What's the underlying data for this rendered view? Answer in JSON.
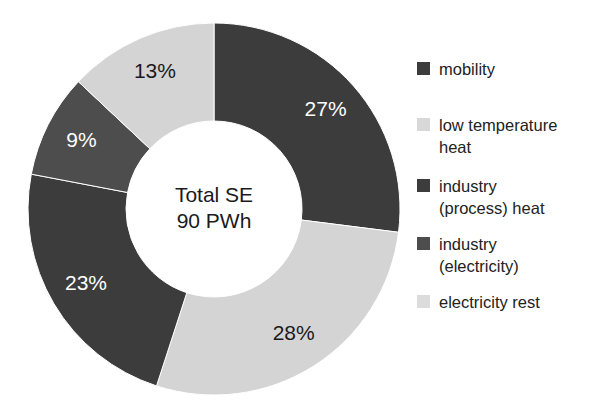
{
  "chart_data": {
    "type": "pie",
    "variant": "donut",
    "title": "",
    "subtitle": "",
    "xlabel": "",
    "ylabel": "",
    "center_label_line1": "Total SE",
    "center_label_line2": "90 PWh",
    "total_value": 90,
    "total_unit": "PWh",
    "grid": false,
    "legend_position": "right",
    "start_angle_deg": 0,
    "direction": "clockwise",
    "categories": [
      "mobility",
      "low temperature heat",
      "industry (process) heat",
      "industry (electricity)",
      "electricity rest"
    ],
    "values": [
      27,
      28,
      23,
      9,
      13
    ],
    "value_unit": "%",
    "data_labels": [
      "27%",
      "28%",
      "23%",
      "9%",
      "13%"
    ],
    "colors": [
      "#3c3c3c",
      "#d4d4d4",
      "#3c3c3c",
      "#4d4d4d",
      "#d4d4d4"
    ],
    "label_text_colors": [
      "#ffffff",
      "#1a1a1a",
      "#ffffff",
      "#ffffff",
      "#1a1a1a"
    ],
    "slices": [
      {
        "name": "mobility",
        "value": 27,
        "label": "27%",
        "color": "#3c3c3c",
        "label_on": "dark"
      },
      {
        "name": "low temperature heat",
        "value": 28,
        "label": "28%",
        "color": "#d4d4d4",
        "label_on": "light"
      },
      {
        "name": "industry (process) heat",
        "value": 23,
        "label": "23%",
        "color": "#3c3c3c",
        "label_on": "dark"
      },
      {
        "name": "industry (electricity)",
        "value": 9,
        "label": "9%",
        "color": "#4d4d4d",
        "label_on": "dark"
      },
      {
        "name": "electricity rest",
        "value": 13,
        "label": "13%",
        "color": "#d4d4d4",
        "label_on": "light"
      }
    ]
  },
  "legend": {
    "items": [
      {
        "label": "mobility",
        "color": "#3c3c3c"
      },
      {
        "label": "low temperature\nheat",
        "color": "#d8d8d8"
      },
      {
        "label": "industry\n(process) heat",
        "color": "#3c3c3c"
      },
      {
        "label": "industry\n(electricity)",
        "color": "#4d4d4d"
      },
      {
        "label": "electricity rest",
        "color": "#dcdcdc"
      }
    ]
  },
  "geometry": {
    "center_x": 214,
    "center_y": 209,
    "outer_radius": 186,
    "inner_radius": 88
  }
}
